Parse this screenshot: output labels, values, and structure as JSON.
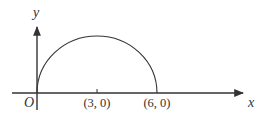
{
  "figure": {
    "type": "semicircle-on-axes",
    "stroke_color": "#333333",
    "background": "#ffffff"
  },
  "axes": {
    "x_label": "x",
    "y_label": "y",
    "origin_label": "O"
  },
  "curve": {
    "description": "upper semicircle through the origin",
    "center": [
      3,
      0
    ],
    "radius": 3,
    "start": [
      0,
      0
    ],
    "end": [
      6,
      0
    ]
  },
  "points": [
    {
      "id": "center",
      "label": "(3, 0)",
      "x": 3,
      "y": 0,
      "tick": true
    },
    {
      "id": "end",
      "label": "(6, 0)",
      "x": 6,
      "y": 0,
      "tick": false
    }
  ]
}
